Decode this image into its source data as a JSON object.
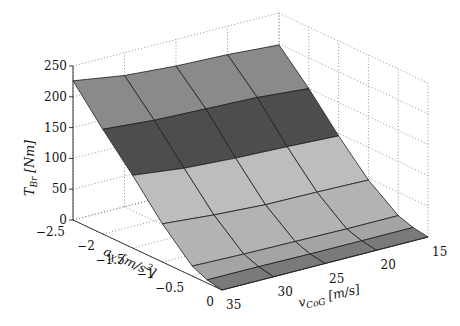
{
  "chart_data": {
    "type": "surface3d",
    "title": "",
    "xlabel": "v_CoG [m/s]",
    "ylabel": "a_X [m/s^2]",
    "zlabel": "T_Br [Nm]",
    "xlabel_display": {
      "base": "v",
      "sub": "CoG",
      "unit": " [m/s]"
    },
    "ylabel_display": {
      "base": "a",
      "sub": "X",
      "unit": " [m/s",
      "sup": "2",
      "unit_end": "]"
    },
    "zlabel_display": {
      "base": "T",
      "sub": "Br",
      "unit": " [Nm]"
    },
    "x_ticks": [
      "15",
      "20",
      "25",
      "30",
      "35"
    ],
    "y_ticks": [
      "-2.5",
      "-2",
      "-1.5",
      "-1",
      "-0.5",
      "0"
    ],
    "z_ticks": [
      "0",
      "50",
      "100",
      "150",
      "200",
      "250"
    ],
    "xlim": [
      15,
      35
    ],
    "ylim": [
      -2.5,
      0
    ],
    "zlim": [
      0,
      250
    ],
    "grid": true,
    "x": [
      35,
      30,
      25,
      20,
      15
    ],
    "y": [
      -2.5,
      -2.0,
      -1.5,
      -1.0,
      -0.5,
      -0.25,
      0
    ],
    "z": [
      [
        226,
        213,
        207,
        204,
        198
      ],
      [
        170,
        163,
        160,
        157,
        150
      ],
      [
        118,
        108,
        103,
        100,
        96
      ],
      [
        62,
        55,
        50,
        49,
        47
      ],
      [
        16,
        14,
        13,
        12,
        12
      ],
      [
        5,
        5,
        4,
        4,
        4
      ],
      [
        0,
        0,
        0,
        0,
        0
      ]
    ],
    "row_shades": [
      "#8a8a8a",
      "#4d4d4d",
      "#bdbdbd",
      "#b3b3b3",
      "#a4a4a4",
      "#7a7a7a"
    ],
    "colors": {
      "edge": "#1e1e1e",
      "grid": "#777777",
      "axis": "#222222"
    }
  }
}
